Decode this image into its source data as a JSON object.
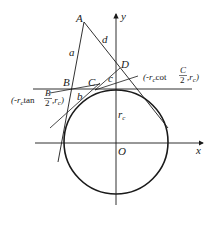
{
  "diagram": {
    "points": {
      "A": "A",
      "B": "B",
      "C": "C",
      "D": "D",
      "O": "O"
    },
    "axes": {
      "x": "x",
      "y": "y"
    },
    "segments": {
      "a": "a",
      "b": "b",
      "c": "c",
      "d": "d"
    },
    "radius_label": {
      "main": "r",
      "sub": "c"
    },
    "coord_B": {
      "prefix": "(-r",
      "sub1": "c",
      "func": "tan",
      "num": "B",
      "den": "2",
      "mid": ",r",
      "sub2": "c",
      "close": ")"
    },
    "coord_C": {
      "prefix": "(-r",
      "sub1": "c",
      "func": "cot",
      "num": "C",
      "den": "2",
      "mid": ",r",
      "sub2": "c",
      "close": ")"
    },
    "colors": {
      "stroke": "#1a1a1a",
      "background": "#ffffff"
    }
  }
}
